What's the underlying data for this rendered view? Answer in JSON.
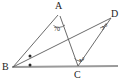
{
  "figure": {
    "stroke_color": "#555555",
    "baseline_color": "#999999",
    "label_color": "#1c1c1c"
  },
  "vertices": [
    {
      "id": "A",
      "label": "A",
      "x": 59,
      "y": 9
    },
    {
      "id": "B",
      "label": "B",
      "x": 8,
      "y": 70
    },
    {
      "id": "C",
      "label": "C",
      "x": 79,
      "y": 72
    },
    {
      "id": "D",
      "label": "D",
      "x": 113,
      "y": 16
    }
  ],
  "angles": [
    {
      "id": "angle-A",
      "label": "70",
      "x": 55,
      "y": 25
    },
    {
      "id": "angle-C",
      "label": "x°",
      "x": 80,
      "y": 60
    },
    {
      "id": "angle-D",
      "label": "y°",
      "x": 103,
      "y": 26
    }
  ],
  "marks": [
    {
      "id": "bisector-dot-upper",
      "x": 30,
      "y": 56
    },
    {
      "id": "bisector-dot-lower",
      "x": 30,
      "y": 65
    }
  ]
}
